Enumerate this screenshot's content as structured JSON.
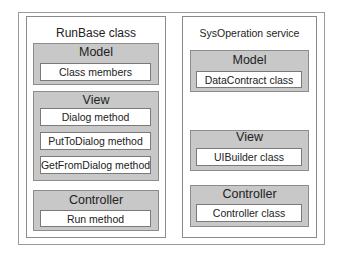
{
  "diagram": {
    "left_panel": {
      "title": "RunBase class",
      "groups": [
        {
          "title": "Model",
          "items": [
            "Class members"
          ]
        },
        {
          "title": "View",
          "items": [
            "Dialog method",
            "PutToDialog method",
            "GetFromDialog method"
          ]
        },
        {
          "title": "Controller",
          "items": [
            "Run method"
          ]
        }
      ]
    },
    "right_panel": {
      "title": "SysOperation service",
      "groups": [
        {
          "title": "Model",
          "items": [
            "DataContract class"
          ]
        },
        {
          "title": "View",
          "items": [
            "UIBuilder class"
          ]
        },
        {
          "title": "Controller",
          "items": [
            "Controller class"
          ]
        }
      ]
    },
    "colors": {
      "group_fill": "#c8c8c8",
      "border": "#8a8a8a",
      "background": "#ffffff"
    }
  }
}
